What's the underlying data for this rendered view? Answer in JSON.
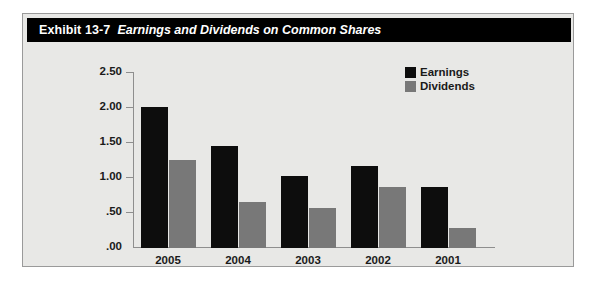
{
  "exhibit": {
    "label": "Exhibit 13-7",
    "title": "Earnings and Dividends on Common Shares"
  },
  "legend": {
    "items": [
      {
        "name": "Earnings",
        "color": "#0d0d0d"
      },
      {
        "name": "Dividends",
        "color": "#787878"
      }
    ]
  },
  "axis": {
    "y_ticks": [
      "2.50",
      "2.00",
      "1.50",
      "1.00",
      ".50",
      ".00"
    ],
    "x_ticks": [
      "2005",
      "2004",
      "2003",
      "2002",
      "2001"
    ]
  },
  "chart_data": {
    "type": "bar",
    "title": "Earnings and Dividends on Common Shares",
    "xlabel": "",
    "ylabel": "",
    "ylim": [
      0.0,
      2.5
    ],
    "ytick_values": [
      2.5,
      2.0,
      1.5,
      1.0,
      0.5,
      0.0
    ],
    "ytick_labels": [
      "2.50",
      "2.00",
      "1.50",
      "1.00",
      ".50",
      ".00"
    ],
    "categories": [
      "2005",
      "2004",
      "2003",
      "2002",
      "2001"
    ],
    "grid": false,
    "legend_position": "top-right",
    "series": [
      {
        "name": "Earnings",
        "color": "#0d0d0d",
        "values": [
          2.0,
          1.45,
          1.03,
          1.16,
          0.87
        ]
      },
      {
        "name": "Dividends",
        "color": "#787878",
        "values": [
          1.25,
          0.66,
          0.57,
          0.87,
          0.28
        ]
      }
    ]
  }
}
